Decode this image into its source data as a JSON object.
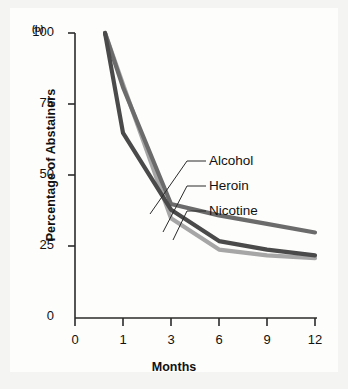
{
  "figure": {
    "panel_label": "(b)"
  },
  "chart_data": {
    "type": "line",
    "title": "",
    "xlabel": "Months",
    "ylabel": "Percentage of Abstainers",
    "x": [
      0,
      1,
      3,
      6,
      9,
      12
    ],
    "categories": [
      "0",
      "1",
      "3",
      "6",
      "9",
      "12"
    ],
    "xtick_labels": [
      "0",
      "1",
      "3",
      "6",
      "9",
      "12"
    ],
    "ytick_labels": [
      "0",
      "25",
      "50",
      "75",
      "100"
    ],
    "yticks": [
      0,
      25,
      50,
      75,
      100
    ],
    "ylim": [
      0,
      100
    ],
    "grid": false,
    "legend_position": "inline-callouts",
    "series": [
      {
        "name": "Alcohol",
        "color": "#6b6b6b",
        "values": [
          100,
          81,
          40,
          36,
          33,
          30
        ]
      },
      {
        "name": "Heroin",
        "color": "#4a4a4a",
        "values": [
          100,
          65,
          38,
          27,
          24,
          22
        ]
      },
      {
        "name": "Nicotine",
        "color": "#a6a6a6",
        "values": [
          100,
          82,
          35,
          24,
          22,
          21
        ]
      }
    ],
    "annotations": [
      {
        "label": "Alcohol",
        "points_to_series": "Alcohol"
      },
      {
        "label": "Heroin",
        "points_to_series": "Heroin"
      },
      {
        "label": "Nicotine",
        "points_to_series": "Nicotine"
      }
    ],
    "axis_color": "#2a2a2a"
  }
}
